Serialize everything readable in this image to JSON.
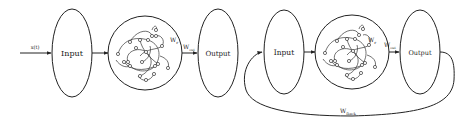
{
  "diagrams": [
    {
      "id": "esn",
      "input_signal_label": "x(t)",
      "input_label": "Input",
      "reservoir_weight_label": "W",
      "reservoir_weight_sub": "r",
      "output_weight_label": "W",
      "output_weight_sub": "out",
      "output_label": "Output"
    },
    {
      "id": "esn-feedback",
      "input_label": "Input",
      "reservoir_weight_label": "W",
      "reservoir_weight_sub": "r",
      "output_weight_label": "W",
      "output_weight_sub": "out",
      "output_label": "Output",
      "feedback_weight_label": "W",
      "feedback_weight_sub": "fback"
    }
  ],
  "colors": {
    "stroke": "#222222",
    "background": "#ffffff"
  }
}
